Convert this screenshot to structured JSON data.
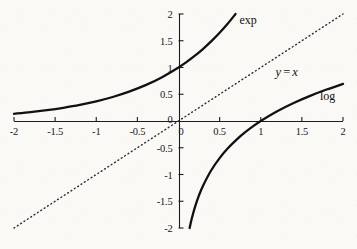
{
  "chart_data": {
    "type": "line",
    "title": "",
    "xlabel": "",
    "ylabel": "",
    "xlim": [
      -2,
      2
    ],
    "ylim": [
      -2,
      2
    ],
    "grid": false,
    "legend": "inline-annotations",
    "xticks": [
      -2,
      -1.5,
      -1,
      -0.5,
      0,
      0.5,
      1,
      1.5,
      2
    ],
    "xtick_labels": [
      "-2",
      "-1.5",
      "-1",
      "-0.5",
      "0",
      "0.5",
      "1",
      "1.5",
      "2"
    ],
    "yticks": [
      -2,
      -1.5,
      -1,
      -0.5,
      0,
      0.5,
      1,
      1.5,
      2
    ],
    "ytick_labels": [
      "-2",
      "-1.5",
      "-1",
      "-0.5",
      "0",
      "0.5",
      "1",
      "1.5",
      "2"
    ],
    "series": [
      {
        "name": "exp",
        "label": "exp",
        "style": "solid",
        "width": 2.3,
        "color": "#111114",
        "x": [
          -2,
          -1.8,
          -1.6,
          -1.4,
          -1.2,
          -1,
          -0.8,
          -0.6,
          -0.4,
          -0.2,
          0,
          0.1,
          0.2,
          0.3,
          0.4,
          0.5,
          0.6,
          0.6931
        ],
        "y": [
          0.135,
          0.165,
          0.202,
          0.247,
          0.301,
          0.368,
          0.449,
          0.549,
          0.67,
          0.819,
          1.0,
          1.105,
          1.221,
          1.35,
          1.492,
          1.649,
          1.822,
          2.0
        ]
      },
      {
        "name": "log",
        "label": "log",
        "style": "solid",
        "width": 2.3,
        "color": "#111114",
        "x": [
          0.1353,
          0.16,
          0.2,
          0.25,
          0.3,
          0.4,
          0.5,
          0.6,
          0.7,
          0.8,
          0.9,
          1,
          1.2,
          1.4,
          1.6,
          1.8,
          2
        ],
        "y": [
          -2.0,
          -1.833,
          -1.609,
          -1.386,
          -1.204,
          -0.916,
          -0.693,
          -0.511,
          -0.357,
          -0.223,
          -0.105,
          0,
          0.182,
          0.336,
          0.47,
          0.588,
          0.693
        ]
      },
      {
        "name": "identity",
        "label": "y = x",
        "style": "dotted",
        "width": 1.4,
        "color": "#2a2a2e",
        "x": [
          -2,
          2
        ],
        "y": [
          -2,
          2
        ]
      }
    ],
    "annotations": [
      {
        "name": "exp-label",
        "text": "exp",
        "x": 0.74,
        "y": 1.88
      },
      {
        "name": "identity-label",
        "text": "y = x",
        "math": true,
        "var1": "y",
        "op": "=",
        "var2": "x",
        "x": 1.18,
        "y": 0.92
      },
      {
        "name": "log-label",
        "text": "log",
        "x": 1.72,
        "y": 0.47
      }
    ]
  },
  "axes": {
    "x_axis_name": "x-axis",
    "y_axis_name": "y-axis",
    "origin_label": "0"
  }
}
